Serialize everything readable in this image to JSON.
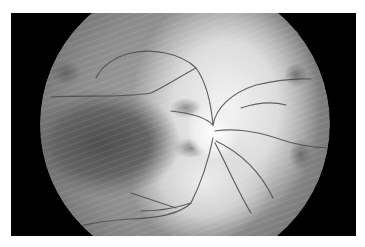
{
  "image": {
    "kind": "fundus-photograph",
    "mode": "grayscale",
    "colors": {
      "background": "#ffffff",
      "frame": "#000000",
      "retina_base": "#8a8a8a",
      "bright_region": "#e6e6e6",
      "macula_dark": "#5c5c5c",
      "vessel": "#4a4a4a"
    }
  }
}
